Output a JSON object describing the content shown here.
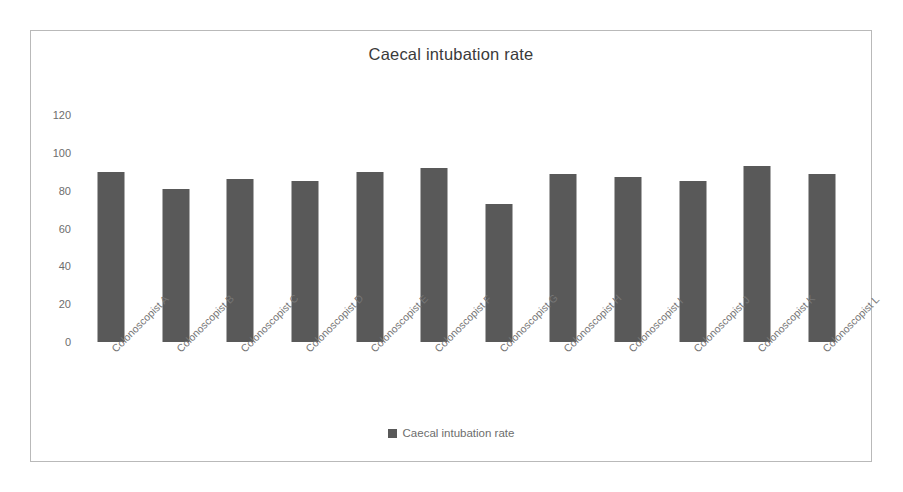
{
  "chart_data": {
    "type": "bar",
    "title": "Caecal intubation rate",
    "xlabel": "",
    "ylabel": "",
    "ylim": [
      0,
      120
    ],
    "yticks": [
      0,
      20,
      40,
      60,
      80,
      100,
      120
    ],
    "grid": false,
    "legend_position": "bottom",
    "series": [
      {
        "name": "Caecal intubation rate",
        "color": "#595959",
        "values": [
          90,
          81,
          86,
          85,
          90,
          92,
          73,
          89,
          87,
          85,
          93,
          89
        ]
      }
    ],
    "categories": [
      "Colonoscopist A",
      "Colonoscopist B",
      "Colonoscopist C",
      "Colonoscopist D",
      "Colonoscopist E",
      "Colonoscopist F",
      "Colonoscopist G",
      "Colonoscopist H",
      "Colonoscopist I",
      "Colonoscopist J",
      "Colonoscopist K",
      "Colonoscopist L"
    ]
  },
  "legend": {
    "entries": [
      {
        "label": "Caecal intubation rate",
        "color": "#595959"
      }
    ]
  },
  "colors": {
    "bar": "#595959",
    "frame": "#b9b9b9",
    "title_text": "#3a3a3a",
    "axis_text": "#6d6d6d",
    "category_text": "#767676",
    "background": "#ffffff"
  }
}
